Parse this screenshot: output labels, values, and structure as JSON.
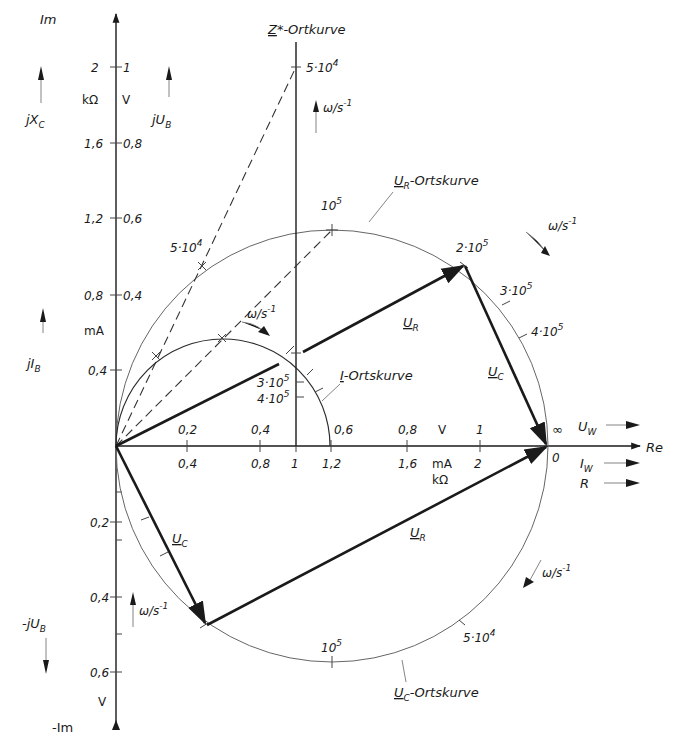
{
  "axes": {
    "re_label": "Re",
    "im_label": "Im",
    "neg_im_label": "-Im",
    "im_units_left": "kΩ",
    "im_units_right": "V",
    "im_unit_current": "mA",
    "im_unit_neg": "V",
    "re_unit_voltage": "V",
    "re_unit_current": "mA",
    "re_unit_resistance": "kΩ",
    "im_ticks_upper": [
      {
        "left": "2",
        "right": "1"
      },
      {
        "left": "1,6",
        "right": "0,8"
      },
      {
        "left": "1,2",
        "right": "0,6"
      },
      {
        "left": "0,8",
        "right": "0,4"
      },
      {
        "left": "0,4",
        "right": ""
      }
    ],
    "im_ticks_lower": [
      "0,2",
      "0,4",
      "0,6"
    ],
    "re_ticks_voltage": [
      "0,2",
      "0,4",
      "0,6",
      "0,8",
      "1"
    ],
    "re_ticks_current_resistance": [
      "0,4",
      "0,8",
      "1",
      "1,2",
      "1,6",
      "2"
    ]
  },
  "direction_labels": {
    "jXc": "jX",
    "jXc_sub": "C",
    "jUb": "jU",
    "jUb_sub": "B",
    "jIb": "jI",
    "jIb_sub": "B",
    "neg_jUb": "-jU",
    "neg_jUb_sub": "B",
    "Uw": "U",
    "Uw_sub": "W",
    "Iw": "I",
    "Iw_sub": "W",
    "R": "R"
  },
  "curves": {
    "z_star": {
      "name": "Z",
      "suffix": "*-Ortkurve",
      "point_label": "5·10",
      "point_exp": "4"
    },
    "u_r": {
      "name": "U",
      "sub": "R",
      "suffix": "-Ortskurve"
    },
    "u_c": {
      "name": "U",
      "sub": "C",
      "suffix": "-Ortskurve"
    },
    "i": {
      "name": "I",
      "suffix": "-Ortskurve"
    }
  },
  "frequency_marks": {
    "omega_unit": "ω/s",
    "omega_exp": "-1",
    "m_5e4": {
      "base": "5·10",
      "exp": "4"
    },
    "m_1e5": {
      "base": "10",
      "exp": "5"
    },
    "m_2e5": {
      "base": "2·10",
      "exp": "5"
    },
    "m_3e5": {
      "base": "3·10",
      "exp": "5"
    },
    "m_4e5": {
      "base": "4·10",
      "exp": "5"
    },
    "infinity": "∞",
    "zero": "0"
  },
  "phasors": {
    "ur_upper": {
      "name": "U",
      "sub": "R"
    },
    "uc_upper": {
      "name": "U",
      "sub": "C"
    },
    "ur_lower": {
      "name": "U",
      "sub": "R"
    },
    "uc_lower": {
      "name": "U",
      "sub": "C"
    }
  }
}
